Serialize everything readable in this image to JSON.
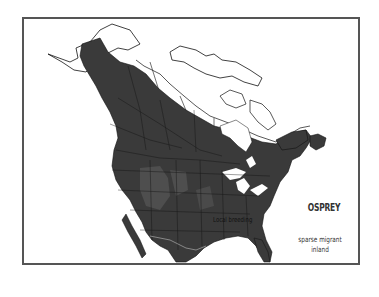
{
  "map": {
    "title": "OSPREY",
    "labels": {
      "local_breeding": "Local breeding",
      "sparse_migrant_line1": "sparse migrant",
      "sparse_migrant_line2": "inland"
    },
    "colors": {
      "range_dark": "#3a3a3a",
      "range_medium": "#4e4e4e",
      "background": "#ffffff",
      "border": "#555555",
      "outline": "#111111"
    }
  }
}
